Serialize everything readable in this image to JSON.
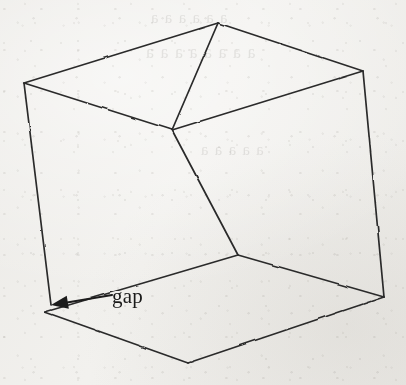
{
  "figure": {
    "kind": "hand-drawn-wireframe-cube",
    "caption_label": "gap",
    "medium": "scanned paper, pen line drawing",
    "background_color": "#f2f1ee",
    "ink_color": "#2b2b2b",
    "label_color": "#1a1a1a"
  },
  "annotation": {
    "label": "gap",
    "arrow": {
      "name": "gap-arrow",
      "tail_x": 112,
      "tail_y": 295,
      "tip_x": 51,
      "tip_y": 305,
      "head_style": "solid-filled-triangle"
    }
  },
  "cube": {
    "description": "Wireframe box drawn in perspective; the left vertical edge stops short of the bottom-left floor corner, leaving a gap.",
    "vertices": {
      "top_back": {
        "x": 218,
        "y": 23
      },
      "top_left": {
        "x": 24,
        "y": 83
      },
      "top_right": {
        "x": 363,
        "y": 71
      },
      "top_front": {
        "x": 172,
        "y": 130
      },
      "bottom_left": {
        "x": 45,
        "y": 312
      },
      "bottom_right": {
        "x": 384,
        "y": 297
      },
      "bottom_front": {
        "x": 188,
        "y": 363
      },
      "bottom_center": {
        "x": 238,
        "y": 255
      },
      "left_edge_end": {
        "x": 51,
        "y": 305
      }
    },
    "edges": [
      {
        "name": "top-face-back-left",
        "from": "top_left",
        "to": "top_back"
      },
      {
        "name": "top-face-back-right",
        "from": "top_back",
        "to": "top_right"
      },
      {
        "name": "top-face-front-left",
        "from": "top_left",
        "to": "top_front"
      },
      {
        "name": "top-face-front-right",
        "from": "top_front",
        "to": "top_right"
      },
      {
        "name": "vertical-back-center",
        "from": "top_back",
        "to": "top_front"
      },
      {
        "name": "vertical-left",
        "from": "top_left",
        "to": "left_edge_end"
      },
      {
        "name": "vertical-right",
        "from": "top_right",
        "to": "bottom_right"
      },
      {
        "name": "vertical-center",
        "from": "top_front",
        "to": "bottom_center"
      },
      {
        "name": "floor-back-left",
        "from": "bottom_left",
        "to": "bottom_center"
      },
      {
        "name": "floor-back-right",
        "from": "bottom_center",
        "to": "bottom_right"
      },
      {
        "name": "floor-front-left",
        "from": "bottom_left",
        "to": "bottom_front"
      },
      {
        "name": "floor-front-right",
        "from": "bottom_front",
        "to": "bottom_right"
      }
    ],
    "gap_between": [
      "vertical-left",
      "bottom_left"
    ]
  },
  "ghost_text": {
    "note": "Illegible bleed-through from the reverse side of the page",
    "lines": [
      {
        "text": "a a a a a a",
        "x": 150,
        "y": 8,
        "size": 17
      },
      {
        "text": "a a a a a a a a",
        "x": 145,
        "y": 42,
        "size": 18
      },
      {
        "text": "a a a a a",
        "x": 200,
        "y": 140,
        "size": 17
      }
    ]
  }
}
